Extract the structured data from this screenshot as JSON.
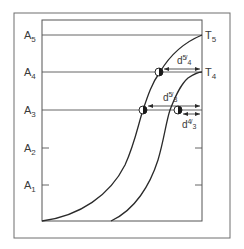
{
  "diagram": {
    "y_levels": [
      {
        "label": "A",
        "sub": "5"
      },
      {
        "label": "A",
        "sub": "4"
      },
      {
        "label": "A",
        "sub": "3"
      },
      {
        "label": "A",
        "sub": "2"
      },
      {
        "label": "A",
        "sub": "1"
      }
    ],
    "curves": [
      {
        "label": "T",
        "sub": "5"
      },
      {
        "label": "T",
        "sub": "4"
      }
    ],
    "dimensions": [
      {
        "label": "d",
        "sup": "5",
        "sub": "4",
        "text": "d 5/4"
      },
      {
        "label": "d",
        "sup": "5",
        "sub": "3",
        "text": "d 5/3"
      },
      {
        "label": "d",
        "sup": "4",
        "sub": "3",
        "text": "d 4/3"
      }
    ],
    "colors": {
      "line": "#3a3a3a",
      "frame": "#6e6e6e",
      "background": "#ffffff"
    }
  }
}
